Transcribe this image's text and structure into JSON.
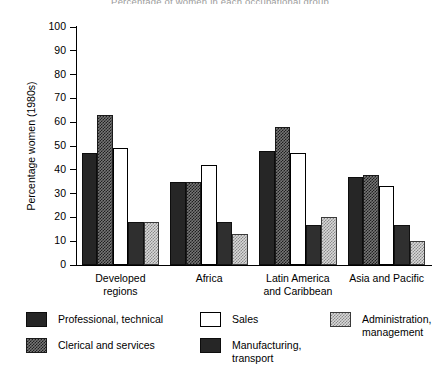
{
  "title": "Percentage of women in each occupational group",
  "chart_data": {
    "type": "bar",
    "title": "Percentage of women in each occupational group",
    "xlabel": "",
    "ylabel": "Percentage women (1980s)",
    "ylim": [
      0,
      100
    ],
    "ytick_step": 10,
    "yticks": [
      "100",
      "90",
      "80",
      "70",
      "60",
      "50",
      "40",
      "30",
      "20",
      "10",
      "0"
    ],
    "grid": false,
    "legend_position": "bottom",
    "categories": [
      "Developed\nregions",
      "Africa",
      "Latin America\nand Caribbean",
      "Asia and Pacific"
    ],
    "series": [
      {
        "name": "Professional, technical",
        "key": "prof",
        "swatch": "solid-dark",
        "values": [
          47,
          35,
          48,
          37
        ]
      },
      {
        "name": "Clerical and services",
        "key": "cler",
        "swatch": "checker-dark",
        "values": [
          63,
          35,
          58,
          38
        ]
      },
      {
        "name": "Sales",
        "key": "sale",
        "swatch": "white-outline",
        "values": [
          49,
          42,
          47,
          33
        ]
      },
      {
        "name": "Manufacturing,\ntransport",
        "key": "manu",
        "swatch": "solid-dark",
        "values": [
          18,
          18,
          17,
          17
        ]
      },
      {
        "name": "Administration,\nmanagement",
        "key": "admi",
        "swatch": "checker-light",
        "values": [
          18,
          13,
          20,
          10
        ]
      }
    ]
  },
  "legend": {
    "items": [
      {
        "label": "Professional, technical",
        "swatch": "solid-dark"
      },
      {
        "label": "Clerical and services",
        "swatch": "checker-dark"
      },
      {
        "label": "Sales",
        "swatch": "white-outline"
      },
      {
        "label": "Manufacturing,\ntransport",
        "swatch": "solid-dark"
      },
      {
        "label": "Administration,\nmanagement",
        "swatch": "checker-light"
      }
    ]
  },
  "colors": {
    "solid_dark": "#262626",
    "checker_dark": "#767676",
    "white_outline": "#ffffff",
    "checker_light": "#d8d8d8",
    "axis": "#000000"
  }
}
